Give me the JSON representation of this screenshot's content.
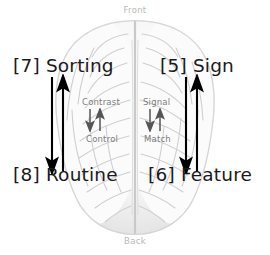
{
  "figure": {
    "background_color": "#ffffff",
    "image": "brain-top-view-grayscale",
    "orientation": {
      "front_label": "Front",
      "back_label": "Back",
      "label_color": "#b9b9b9"
    },
    "regions": [
      {
        "id": "region-sorting",
        "index": "[7]",
        "label": "[7] Sorting",
        "hemisphere": "left",
        "position": "anterior",
        "color": "#1a1a1a"
      },
      {
        "id": "region-sign",
        "index": "[5]",
        "label": "[5] Sign",
        "hemisphere": "right",
        "position": "anterior",
        "color": "#1a1a1a"
      },
      {
        "id": "region-routine",
        "index": "[8]",
        "label": "[8] Routine",
        "hemisphere": "left",
        "position": "posterior",
        "color": "#1a1a1a"
      },
      {
        "id": "region-feature",
        "index": "[6]",
        "label": "[6] Feature",
        "hemisphere": "right",
        "position": "posterior",
        "color": "#1a1a1a"
      }
    ],
    "inner_labels": [
      {
        "id": "inner-contrast",
        "label": "Contrast",
        "hemisphere": "left",
        "position": "anterior",
        "color": "#7d7d7d"
      },
      {
        "id": "inner-control",
        "label": "Control",
        "hemisphere": "left",
        "position": "posterior",
        "color": "#7d7d7d"
      },
      {
        "id": "inner-signal",
        "label": "Signal",
        "hemisphere": "right",
        "position": "anterior",
        "color": "#7d7d7d"
      },
      {
        "id": "inner-match",
        "label": "Match",
        "hemisphere": "right",
        "position": "posterior",
        "color": "#7d7d7d"
      }
    ],
    "arrow_groups": [
      {
        "id": "arrows-left",
        "connects": [
          "[7] Sorting",
          "[8] Routine"
        ],
        "directions": [
          "down",
          "up"
        ],
        "color": "#000000",
        "size": "large"
      },
      {
        "id": "arrows-right",
        "connects": [
          "[5] Sign",
          "[6] Feature"
        ],
        "directions": [
          "down",
          "up"
        ],
        "color": "#000000",
        "size": "large"
      },
      {
        "id": "arrows-mid-left",
        "connects": [
          "Contrast",
          "Control"
        ],
        "directions": [
          "down",
          "up"
        ],
        "color": "#555555",
        "size": "small"
      },
      {
        "id": "arrows-mid-right",
        "connects": [
          "Signal",
          "Match"
        ],
        "directions": [
          "down",
          "up"
        ],
        "color": "#555555",
        "size": "small"
      }
    ]
  }
}
